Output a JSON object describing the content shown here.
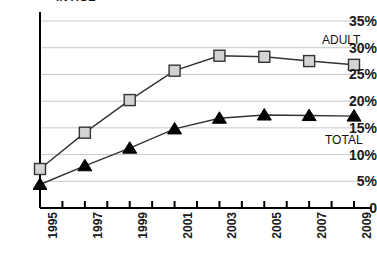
{
  "chart": {
    "title": "IN AGE",
    "title_clipped": true,
    "ylabels": [
      "35%",
      "30%",
      "25%",
      "20%",
      "15%",
      "10%",
      "5%",
      "0"
    ],
    "xlabels": [
      "1995",
      "1997",
      "1999",
      "2001",
      "2003",
      "2005",
      "2007",
      "2009"
    ],
    "series_label_adult": "ADULT",
    "series_label_total": "TOTAL"
  },
  "chart_data": {
    "type": "line",
    "title": "IN AGE",
    "xlabel": "",
    "ylabel": "",
    "x": [
      1995,
      1997,
      1999,
      2001,
      2003,
      2005,
      2007,
      2009
    ],
    "categories": [
      "1995",
      "1997",
      "1999",
      "2001",
      "2003",
      "2005",
      "2007",
      "2009"
    ],
    "xlim": [
      1995,
      2009
    ],
    "ylim": [
      0,
      35
    ],
    "yticks": [
      0,
      5,
      10,
      15,
      20,
      25,
      30,
      35
    ],
    "ytick_labels": [
      "0",
      "5%",
      "10%",
      "15%",
      "20%",
      "25%",
      "30%",
      "35%"
    ],
    "grid": true,
    "grid_axis": "y",
    "legend": "inline-right",
    "unit": "percent",
    "minor_xticks_every_year": true,
    "series": [
      {
        "name": "ADULT",
        "marker": "square",
        "marker_fill": "#d4d4d4",
        "marker_edge": "#333333",
        "line_color": "#333333",
        "values": [
          7.3,
          14.1,
          20.2,
          25.7,
          28.5,
          28.3,
          27.5,
          26.8
        ]
      },
      {
        "name": "TOTAL",
        "marker": "triangle",
        "marker_fill": "#000000",
        "marker_edge": "#000000",
        "line_color": "#333333",
        "values": [
          4.4,
          7.9,
          11.2,
          14.8,
          16.8,
          17.4,
          17.3,
          17.2
        ]
      }
    ]
  },
  "colors": {
    "adult_marker": "#d4d4d4",
    "total_marker": "#000000",
    "line": "#333333",
    "grid": "#c8c8c8",
    "axis": "#000000",
    "text": "#1a1a1a"
  }
}
